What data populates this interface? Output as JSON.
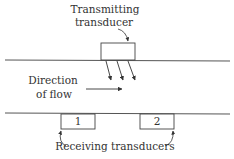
{
  "diagram": {
    "labels": {
      "transmitting_line1": "Transmitting",
      "transmitting_line2": "transducer",
      "direction_line1": "Direction",
      "direction_line2": "of flow",
      "receiving": "Receiving transducers",
      "receiver_1": "1",
      "receiver_2": "2"
    },
    "colors": {
      "stroke": "#333333",
      "background": "#ffffff"
    }
  }
}
